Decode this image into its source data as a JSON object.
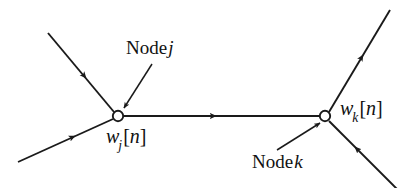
{
  "figure": {
    "type": "signal-flow-graph",
    "background_color": "#ffffff",
    "stroke_color": "#1a1a1a",
    "width": 413,
    "height": 188
  },
  "labels": {
    "node_j": {
      "text": "Node",
      "variable": "j"
    },
    "node_k": {
      "text": "Node",
      "variable": "k"
    },
    "weight_j": {
      "w": "w",
      "subscript": "j",
      "open": "[",
      "n": "n",
      "close": "]"
    },
    "weight_k": {
      "w": "w",
      "subscript": "k",
      "open": "[",
      "n": "n",
      "close": "]"
    }
  },
  "nodes": [
    {
      "id": "j",
      "cx": 118,
      "cy": 116,
      "r": 5.2,
      "fill": "#ffffff"
    },
    {
      "id": "k",
      "cx": 325,
      "cy": 116,
      "r": 5.2,
      "fill": "#ffffff"
    }
  ],
  "edges": [
    {
      "id": "in-upper-left-to-j",
      "x1": 48,
      "y1": 33,
      "x2": 114,
      "y2": 112,
      "direction": "toward-node-j",
      "arrow_at": 0.55
    },
    {
      "id": "in-lower-left-to-j",
      "x1": 18,
      "y1": 162,
      "x2": 113,
      "y2": 119,
      "direction": "toward-node-j",
      "arrow_at": 0.62
    },
    {
      "id": "j-to-k",
      "x1": 124,
      "y1": 116,
      "x2": 319,
      "y2": 116,
      "direction": "toward-node-k",
      "arrow_at": 0.47
    },
    {
      "id": "k-to-upper-right",
      "x1": 329,
      "y1": 112,
      "x2": 390,
      "y2": 10,
      "direction": "away-from-node-k",
      "arrow_at": 0.55
    },
    {
      "id": "in-lower-right-to-k",
      "x1": 398,
      "y1": 190,
      "x2": 329,
      "y2": 121,
      "direction": "toward-node-k",
      "arrow_at": 0.62
    }
  ],
  "pointers": [
    {
      "id": "pointer-node-j",
      "x1": 152,
      "y1": 64,
      "x2": 123,
      "y2": 109,
      "target": "node-j"
    },
    {
      "id": "pointer-node-k",
      "x1": 278,
      "y1": 149,
      "x2": 320,
      "y2": 122,
      "target": "node-k"
    }
  ]
}
